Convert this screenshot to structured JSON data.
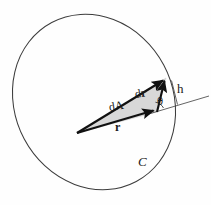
{
  "figure": {
    "background_color": "#fefefe",
    "stroke_color": "#3c3c3c",
    "vector_color": "#111111",
    "fill_color": "#d8d8d8",
    "labels": {
      "area_element": "dA",
      "displacement_prefix": "d",
      "displacement_vector": "r",
      "radius_vector": "r",
      "angle": "θ",
      "height": "h",
      "curve": "C"
    },
    "geometry": {
      "ellipse": {
        "center_x": 94,
        "center_y": 102,
        "radius_x": 79,
        "radius_y": 90,
        "rotation_deg": -28
      },
      "origin": {
        "x": 77,
        "y": 133
      },
      "dr_tail": {
        "x": 157,
        "y": 112
      },
      "dr_tip": {
        "x": 166,
        "y": 78
      },
      "tangent_line": {
        "x1": 148,
        "y1": 114,
        "x2": 209,
        "y2": 96
      },
      "height_segment": {
        "x1": 173,
        "y1": 82,
        "x2": 177,
        "y2": 104
      }
    }
  }
}
